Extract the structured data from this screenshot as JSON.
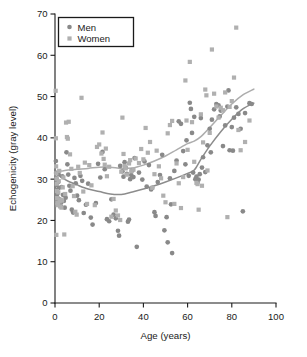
{
  "chart_data": {
    "type": "scatter",
    "title": "",
    "xlabel": "Age (years)",
    "ylabel": "Echogenicity (gray level)",
    "xlim": [
      0,
      100
    ],
    "ylim": [
      0,
      70
    ],
    "xticks": [
      0,
      20,
      40,
      60,
      80,
      100
    ],
    "yticks": [
      0,
      10,
      20,
      30,
      40,
      50,
      60,
      70
    ],
    "xtick_labels": [
      "0",
      "20",
      "40",
      "60",
      "80",
      "100"
    ],
    "ytick_labels": [
      "0",
      "10",
      "20",
      "30",
      "40",
      "50",
      "60",
      "70"
    ],
    "grid": false,
    "legend_position": "top-left",
    "legend": [
      {
        "name": "Men",
        "marker": "circle",
        "color": "#898989"
      },
      {
        "name": "Women",
        "marker": "square",
        "color": "#b0b0b0"
      }
    ],
    "series": [
      {
        "name": "Men",
        "marker": "circle",
        "color": "#898989",
        "points": [
          [
            0.4,
            34.4
          ],
          [
            0.5,
            31.5
          ],
          [
            0.6,
            30.2
          ],
          [
            0.7,
            28.6
          ],
          [
            0.8,
            27.4
          ],
          [
            0.9,
            25.8
          ],
          [
            1.0,
            24.6
          ],
          [
            1.1,
            23.9
          ],
          [
            1.2,
            26.6
          ],
          [
            1.4,
            29.3
          ],
          [
            1.6,
            31.2
          ],
          [
            1.8,
            27.9
          ],
          [
            2.0,
            25.1
          ],
          [
            2.2,
            24.0
          ],
          [
            2.5,
            23.6
          ],
          [
            2.8,
            24.4
          ],
          [
            3.0,
            28.1
          ],
          [
            3.3,
            30.7
          ],
          [
            3.6,
            26.2
          ],
          [
            4.0,
            24.7
          ],
          [
            4.4,
            23.1
          ],
          [
            4.8,
            25.5
          ],
          [
            5.2,
            36.5
          ],
          [
            5.6,
            33.6
          ],
          [
            6.0,
            31.1
          ],
          [
            6.5,
            28.4
          ],
          [
            7.0,
            27.2
          ],
          [
            7.6,
            22.6
          ],
          [
            8.2,
            21.9
          ],
          [
            8.8,
            30.3
          ],
          [
            9.4,
            29.0
          ],
          [
            10.0,
            26.0
          ],
          [
            10.8,
            24.9
          ],
          [
            11.5,
            30.8
          ],
          [
            12.3,
            29.6
          ],
          [
            13.0,
            21.8
          ],
          [
            14.0,
            23.8
          ],
          [
            15.0,
            28.9
          ],
          [
            16.2,
            20.7
          ],
          [
            17.0,
            19.0
          ],
          [
            18.5,
            24.2
          ],
          [
            19.5,
            33.7
          ],
          [
            20.5,
            30.4
          ],
          [
            21.5,
            36.6
          ],
          [
            22.5,
            32.4
          ],
          [
            23.5,
            20.3
          ],
          [
            24.5,
            19.8
          ],
          [
            25.5,
            25.1
          ],
          [
            26.5,
            21.4
          ],
          [
            27.5,
            20.5
          ],
          [
            28.5,
            17.5
          ],
          [
            29.0,
            16.3
          ],
          [
            29.5,
            33.2
          ],
          [
            30.5,
            31.9
          ],
          [
            31.0,
            30.6
          ],
          [
            31.5,
            34.1
          ],
          [
            32.0,
            32.8
          ],
          [
            32.5,
            31.3
          ],
          [
            33.0,
            19.7
          ],
          [
            33.5,
            20.2
          ],
          [
            34.0,
            30.0
          ],
          [
            34.5,
            31.0
          ],
          [
            35.0,
            32.1
          ],
          [
            35.5,
            30.5
          ],
          [
            36.0,
            35.1
          ],
          [
            37.0,
            13.6
          ],
          [
            38.0,
            31.6
          ],
          [
            39.5,
            29.9
          ],
          [
            40.5,
            34.3
          ],
          [
            41.5,
            28.2
          ],
          [
            42.5,
            33.4
          ],
          [
            43.5,
            27.5
          ],
          [
            44.0,
            27.9
          ],
          [
            45.0,
            22.0
          ],
          [
            45.5,
            21.1
          ],
          [
            46.5,
            29.3
          ],
          [
            47.5,
            31.0
          ],
          [
            48.5,
            35.9
          ],
          [
            49.5,
            17.6
          ],
          [
            50.5,
            20.8
          ],
          [
            51.0,
            14.7
          ],
          [
            52.0,
            30.2
          ],
          [
            52.5,
            23.9
          ],
          [
            53.0,
            12.1
          ],
          [
            54.0,
            32.0
          ],
          [
            55.0,
            34.5
          ],
          [
            56.0,
            44.0
          ],
          [
            57.0,
            43.4
          ],
          [
            58.0,
            36.8
          ],
          [
            59.0,
            33.6
          ],
          [
            59.5,
            39.4
          ],
          [
            60.5,
            30.8
          ],
          [
            61.0,
            48.5
          ],
          [
            61.5,
            47.0
          ],
          [
            62.0,
            41.2
          ],
          [
            62.5,
            31.6
          ],
          [
            63.0,
            45.1
          ],
          [
            63.5,
            30.0
          ],
          [
            64.0,
            30.6
          ],
          [
            64.5,
            29.2
          ],
          [
            65.0,
            29.9
          ],
          [
            65.5,
            31.2
          ],
          [
            66.0,
            44.8
          ],
          [
            66.5,
            32.8
          ],
          [
            67.0,
            35.3
          ],
          [
            68.0,
            31.7
          ],
          [
            69.0,
            38.2
          ],
          [
            70.0,
            42.2
          ],
          [
            70.5,
            36.5
          ],
          [
            71.0,
            44.4
          ],
          [
            72.0,
            46.9
          ],
          [
            73.0,
            48.2
          ],
          [
            74.0,
            47.9
          ],
          [
            74.5,
            45.2
          ],
          [
            75.0,
            46.6
          ],
          [
            76.0,
            38.0
          ],
          [
            77.0,
            43.0
          ],
          [
            78.0,
            47.6
          ],
          [
            78.5,
            51.5
          ],
          [
            79.0,
            37.0
          ],
          [
            80.0,
            42.6
          ],
          [
            80.5,
            36.9
          ],
          [
            81.0,
            44.9
          ],
          [
            82.0,
            47.4
          ],
          [
            83.0,
            45.8
          ],
          [
            84.0,
            42.2
          ],
          [
            85.0,
            22.2
          ],
          [
            86.0,
            46.0
          ],
          [
            88.0,
            48.4
          ],
          [
            89.0,
            48.2
          ]
        ]
      },
      {
        "name": "Women",
        "marker": "square",
        "color": "#b0b0b0",
        "points": [
          [
            0.3,
            51.4
          ],
          [
            0.4,
            39.9
          ],
          [
            0.5,
            33.1
          ],
          [
            0.6,
            31.4
          ],
          [
            0.7,
            30.1
          ],
          [
            0.8,
            28.9
          ],
          [
            0.9,
            27.1
          ],
          [
            1.0,
            25.4
          ],
          [
            1.1,
            24.3
          ],
          [
            1.2,
            23.7
          ],
          [
            1.3,
            24.1
          ],
          [
            1.5,
            26.8
          ],
          [
            1.7,
            29.5
          ],
          [
            1.9,
            32.0
          ],
          [
            2.1,
            24.6
          ],
          [
            2.3,
            23.4
          ],
          [
            2.6,
            25.0
          ],
          [
            2.9,
            23.1
          ],
          [
            3.2,
            24.8
          ],
          [
            3.5,
            28.0
          ],
          [
            3.8,
            30.4
          ],
          [
            4.2,
            16.6
          ],
          [
            0.6,
            16.5
          ],
          [
            4.6,
            26.4
          ],
          [
            5.0,
            43.7
          ],
          [
            5.4,
            40.2
          ],
          [
            5.8,
            39.8
          ],
          [
            6.2,
            43.9
          ],
          [
            6.8,
            36.0
          ],
          [
            7.4,
            32.5
          ],
          [
            8.0,
            28.3
          ],
          [
            8.6,
            25.9
          ],
          [
            9.2,
            22.1
          ],
          [
            9.8,
            21.4
          ],
          [
            10.5,
            33.0
          ],
          [
            11.2,
            31.5
          ],
          [
            12.0,
            49.7
          ],
          [
            12.8,
            27.0
          ],
          [
            13.5,
            34.0
          ],
          [
            14.5,
            24.0
          ],
          [
            15.5,
            33.4
          ],
          [
            16.5,
            28.5
          ],
          [
            18.0,
            23.7
          ],
          [
            19.0,
            37.8
          ],
          [
            20.0,
            38.4
          ],
          [
            21.0,
            36.2
          ],
          [
            21.5,
            41.3
          ],
          [
            22.0,
            34.9
          ],
          [
            22.5,
            33.5
          ],
          [
            23.0,
            37.4
          ],
          [
            23.5,
            30.7
          ],
          [
            24.5,
            33.0
          ],
          [
            25.5,
            20.9
          ],
          [
            26.5,
            25.2
          ],
          [
            27.5,
            22.4
          ],
          [
            28.5,
            21.2
          ],
          [
            29.5,
            20.1
          ],
          [
            30.0,
            31.8
          ],
          [
            30.5,
            44.9
          ],
          [
            31.0,
            36.1
          ],
          [
            31.5,
            33.2
          ],
          [
            32.0,
            32.6
          ],
          [
            32.5,
            31.1
          ],
          [
            33.5,
            33.8
          ],
          [
            34.0,
            34.6
          ],
          [
            34.5,
            31.9
          ],
          [
            35.5,
            32.3
          ],
          [
            36.5,
            35.0
          ],
          [
            38.0,
            33.9
          ],
          [
            39.0,
            37.3
          ],
          [
            40.0,
            34.8
          ],
          [
            41.0,
            42.4
          ],
          [
            42.0,
            36.4
          ],
          [
            43.0,
            39.0
          ],
          [
            44.0,
            27.9
          ],
          [
            45.0,
            31.2
          ],
          [
            46.0,
            36.9
          ],
          [
            47.0,
            33.1
          ],
          [
            48.0,
            30.2
          ],
          [
            49.0,
            26.0
          ],
          [
            50.0,
            24.4
          ],
          [
            51.0,
            41.1
          ],
          [
            52.0,
            43.1
          ],
          [
            53.0,
            44.1
          ],
          [
            54.0,
            24.0
          ],
          [
            55.0,
            33.8
          ],
          [
            56.0,
            29.0
          ],
          [
            57.0,
            23.0
          ],
          [
            58.0,
            30.5
          ],
          [
            59.0,
            53.9
          ],
          [
            59.5,
            44.2
          ],
          [
            60.0,
            37.1
          ],
          [
            61.0,
            58.4
          ],
          [
            62.0,
            43.8
          ],
          [
            63.0,
            34.2
          ],
          [
            64.0,
            29.1
          ],
          [
            64.5,
            28.8
          ],
          [
            65.0,
            22.6
          ],
          [
            66.0,
            45.7
          ],
          [
            66.5,
            28.4
          ],
          [
            67.0,
            38.9
          ],
          [
            68.0,
            51.7
          ],
          [
            68.5,
            50.3
          ],
          [
            69.0,
            32.1
          ],
          [
            70.0,
            41.2
          ],
          [
            71.0,
            61.4
          ],
          [
            72.0,
            50.7
          ],
          [
            73.0,
            47.6
          ],
          [
            74.0,
            44.9
          ],
          [
            75.0,
            47.3
          ],
          [
            76.0,
            46.7
          ],
          [
            77.0,
            51.0
          ],
          [
            78.0,
            20.8
          ],
          [
            79.0,
            47.5
          ],
          [
            80.0,
            48.9
          ],
          [
            81.0,
            54.6
          ],
          [
            82.0,
            66.7
          ],
          [
            83.0,
            41.9
          ],
          [
            84.0,
            37.0
          ],
          [
            86.0,
            39.0
          ],
          [
            88.0,
            44.2
          ]
        ]
      }
    ],
    "trend_lines": [
      {
        "name": "Men",
        "color": "#8c8c8c",
        "points": [
          [
            0,
            31.6
          ],
          [
            3,
            30.4
          ],
          [
            6,
            29.5
          ],
          [
            10,
            28.6
          ],
          [
            15,
            27.6
          ],
          [
            20,
            27.0
          ],
          [
            25,
            26.4
          ],
          [
            30,
            26.3
          ],
          [
            35,
            26.9
          ],
          [
            40,
            27.6
          ],
          [
            45,
            28.4
          ],
          [
            50,
            29.3
          ],
          [
            55,
            30.3
          ],
          [
            60,
            31.4
          ],
          [
            63,
            32.2
          ],
          [
            66,
            34.8
          ],
          [
            70,
            38.0
          ],
          [
            75,
            41.5
          ],
          [
            80,
            44.5
          ],
          [
            85,
            47.0
          ],
          [
            90,
            48.4
          ]
        ]
      },
      {
        "name": "Women",
        "color": "#adadad",
        "points": [
          [
            0,
            31.8
          ],
          [
            3,
            32.0
          ],
          [
            6,
            32.2
          ],
          [
            10,
            32.4
          ],
          [
            15,
            32.6
          ],
          [
            20,
            32.9
          ],
          [
            25,
            32.9
          ],
          [
            30,
            32.6
          ],
          [
            35,
            32.7
          ],
          [
            40,
            33.4
          ],
          [
            45,
            34.4
          ],
          [
            50,
            35.6
          ],
          [
            55,
            37.1
          ],
          [
            60,
            38.6
          ],
          [
            63,
            39.2
          ],
          [
            66,
            40.3
          ],
          [
            70,
            42.5
          ],
          [
            75,
            45.4
          ],
          [
            80,
            48.2
          ],
          [
            85,
            50.4
          ],
          [
            90,
            51.8
          ]
        ]
      }
    ]
  },
  "caption": {
    "partial_line": ""
  }
}
